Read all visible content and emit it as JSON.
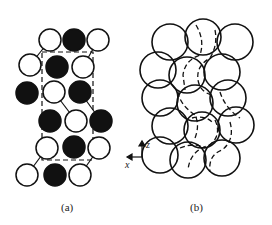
{
  "figure": {
    "panel_a": {
      "label": "(a)",
      "atoms": [
        {
          "x": 50,
          "y": 40,
          "filled": false
        },
        {
          "x": 74,
          "y": 40,
          "filled": true
        },
        {
          "x": 98,
          "y": 40,
          "filled": false
        },
        {
          "x": 30,
          "y": 65,
          "filled": false
        },
        {
          "x": 57,
          "y": 67,
          "filled": true
        },
        {
          "x": 83,
          "y": 67,
          "filled": false
        },
        {
          "x": 27,
          "y": 93,
          "filled": true
        },
        {
          "x": 54,
          "y": 92,
          "filled": false
        },
        {
          "x": 80,
          "y": 92,
          "filled": true
        },
        {
          "x": 50,
          "y": 121,
          "filled": true
        },
        {
          "x": 76,
          "y": 121,
          "filled": false
        },
        {
          "x": 101,
          "y": 121,
          "filled": true
        },
        {
          "x": 47,
          "y": 148,
          "filled": false
        },
        {
          "x": 74,
          "y": 147,
          "filled": true
        },
        {
          "x": 99,
          "y": 148,
          "filled": false
        },
        {
          "x": 27,
          "y": 175,
          "filled": false
        },
        {
          "x": 55,
          "y": 175,
          "filled": true
        },
        {
          "x": 80,
          "y": 175,
          "filled": false
        }
      ],
      "unit_cell": {
        "x1": 42,
        "y1": 52,
        "x2": 93,
        "y2": 160
      }
    },
    "panel_b": {
      "label": "(b)",
      "axes": {
        "vertical": "z",
        "horizontal": "x"
      }
    }
  }
}
